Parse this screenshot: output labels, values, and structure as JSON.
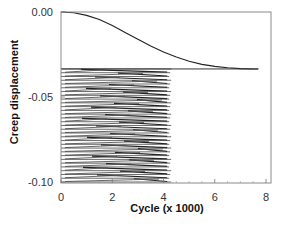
{
  "chart_data": {
    "type": "line",
    "title": "",
    "xlabel": "Cycle (x 1000)",
    "ylabel": "Creep displacement",
    "xlim": [
      0,
      8
    ],
    "ylim": [
      -0.1,
      0.0
    ],
    "xticks": [
      0,
      2,
      4,
      6,
      8
    ],
    "xtick_labels": [
      "0",
      "2",
      "4",
      "6",
      "8"
    ],
    "yticks": [
      0.0,
      -0.05,
      -0.1
    ],
    "ytick_labels": [
      "0.00",
      "-0.05",
      "-0.10"
    ],
    "grid": false,
    "legend": null,
    "series": [
      {
        "name": "creep curve",
        "x": [
          0,
          0.5,
          1.0,
          1.5,
          2.0,
          2.5,
          3.0,
          3.5,
          4.0,
          4.5,
          5.0,
          5.5,
          6.0,
          6.5,
          7.0,
          7.5,
          7.7
        ],
        "y": [
          0.0,
          -0.0005,
          -0.002,
          -0.0045,
          -0.008,
          -0.012,
          -0.016,
          -0.02,
          -0.0235,
          -0.0265,
          -0.029,
          -0.0308,
          -0.032,
          -0.0328,
          -0.0333,
          -0.0335,
          -0.0335
        ]
      },
      {
        "name": "plateau line",
        "x": [
          0,
          7.7
        ],
        "y": [
          -0.0335,
          -0.0335
        ]
      },
      {
        "name": "dense oscillation band",
        "description": "densely stacked horizontal traces between y=-0.0335 and y=-0.100 spanning x=0 to ~4.3",
        "x_range": [
          0,
          4.3
        ],
        "y_range": [
          -0.1,
          -0.0335
        ],
        "row_count": 30
      }
    ]
  }
}
